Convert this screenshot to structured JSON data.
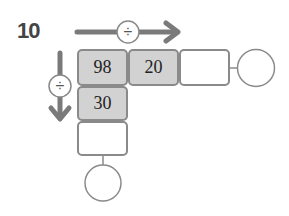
{
  "problem": {
    "number": "10",
    "operator_horizontal": "÷",
    "operator_vertical": "÷",
    "cells": {
      "start": "98",
      "right": "20",
      "down": "30",
      "right_result": "",
      "down_result": ""
    },
    "answer_circles": {
      "right": "",
      "down": ""
    }
  },
  "colors": {
    "filled_cell": "#d2d2d2",
    "border": "#8a8a8a",
    "arrow": "#7a7a7a"
  }
}
